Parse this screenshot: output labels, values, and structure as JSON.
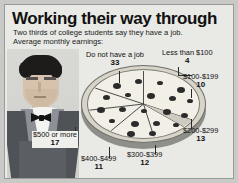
{
  "graphic": {
    "title": "Working their way through",
    "subtitle_line1": "Two thirds of college students say they have a job.",
    "subtitle_line2": "Average monthly earnings:",
    "illustration": "waiter-illustration",
    "chart_shape": "pizza"
  },
  "colors": {
    "page_background": "#c9c9c7",
    "panel_background": "#e9e9e6",
    "panel_border": "#9a9a97",
    "text": "#111111",
    "pizza_top": "#f2efe6",
    "pizza_crust": "#d9d4c8",
    "pepperoni": "#2b2b2b",
    "slice_line": "#3a3a3a",
    "vest": "#4f5358",
    "hair": "#1e1c1b",
    "skin": "#d6c2ad"
  },
  "chart_data": {
    "type": "pie",
    "title": "Working their way through",
    "subtitle": "Two thirds of college students say they have a job. Average monthly earnings:",
    "units": "percent",
    "legend": "none",
    "labels_on_slices": false,
    "categories": [
      "Do not have a job",
      "Less than $100",
      "$100-$199",
      "$200-$299",
      "$300-$399",
      "$400-$499",
      "$500 or more"
    ],
    "values": [
      33,
      4,
      10,
      13,
      12,
      11,
      17
    ],
    "total": 100
  },
  "callouts": [
    {
      "id": "no-job",
      "label": "Do not have a job",
      "value": "33"
    },
    {
      "id": "less-100",
      "label": "Less than $100",
      "value": "4"
    },
    {
      "id": "100-199",
      "label": "$100-$199",
      "value": "10"
    },
    {
      "id": "200-299",
      "label": "$200-$299",
      "value": "13"
    },
    {
      "id": "300-399",
      "label": "$300-$399",
      "value": "12"
    },
    {
      "id": "400-499",
      "label": "$400-$499",
      "value": "11"
    },
    {
      "id": "500-more",
      "label": "$500 or more",
      "value": "17"
    }
  ]
}
